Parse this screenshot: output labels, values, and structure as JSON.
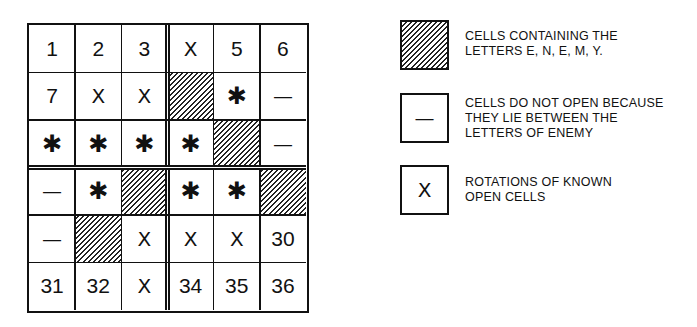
{
  "diagram": {
    "title": "",
    "grid": {
      "rows": 6,
      "cols": 6,
      "cells": [
        [
          {
            "type": "number",
            "text": "1"
          },
          {
            "type": "number",
            "text": "2"
          },
          {
            "type": "number",
            "text": "3"
          },
          {
            "type": "x",
            "text": "X"
          },
          {
            "type": "number",
            "text": "5"
          },
          {
            "type": "number",
            "text": "6"
          }
        ],
        [
          {
            "type": "number",
            "text": "7"
          },
          {
            "type": "x",
            "text": "X"
          },
          {
            "type": "x",
            "text": "X"
          },
          {
            "type": "hatched",
            "text": ""
          },
          {
            "type": "star",
            "text": "✱"
          },
          {
            "type": "dash",
            "text": "—"
          }
        ],
        [
          {
            "type": "star",
            "text": "✱"
          },
          {
            "type": "star",
            "text": "✱"
          },
          {
            "type": "star",
            "text": "✱"
          },
          {
            "type": "star",
            "text": "✱"
          },
          {
            "type": "hatched",
            "text": ""
          },
          {
            "type": "dash",
            "text": "—"
          }
        ],
        [
          {
            "type": "dash",
            "text": "—"
          },
          {
            "type": "star",
            "text": "✱"
          },
          {
            "type": "hatched",
            "text": ""
          },
          {
            "type": "star",
            "text": "✱"
          },
          {
            "type": "star",
            "text": "✱"
          },
          {
            "type": "hatched",
            "text": ""
          }
        ],
        [
          {
            "type": "dash",
            "text": "—"
          },
          {
            "type": "hatched",
            "text": ""
          },
          {
            "type": "x",
            "text": "X"
          },
          {
            "type": "x",
            "text": "X"
          },
          {
            "type": "x",
            "text": "X"
          },
          {
            "type": "number",
            "text": "30"
          }
        ],
        [
          {
            "type": "number",
            "text": "31"
          },
          {
            "type": "number",
            "text": "32"
          },
          {
            "type": "x",
            "text": "X"
          },
          {
            "type": "number",
            "text": "34"
          },
          {
            "type": "number",
            "text": "35"
          },
          {
            "type": "number",
            "text": "36"
          }
        ]
      ]
    },
    "legend": [
      {
        "symbol": "hatched",
        "symbol_text": "",
        "lines": [
          "CELLS CONTAINING THE",
          "LETTERS E, N, E, M, Y."
        ]
      },
      {
        "symbol": "dash",
        "symbol_text": "—",
        "lines": [
          "CELLS DO NOT OPEN BECAUSE",
          "THEY LIE BETWEEN THE",
          "LETTERS OF ENEMY"
        ]
      },
      {
        "symbol": "x",
        "symbol_text": "X",
        "lines": [
          "ROTATIONS OF KNOWN",
          "OPEN CELLS"
        ]
      }
    ]
  }
}
